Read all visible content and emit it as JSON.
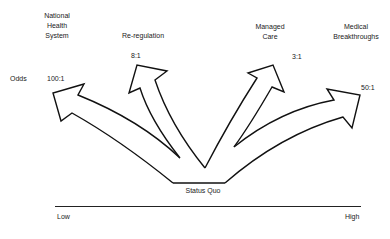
{
  "options": [
    {
      "name_lines": [
        "National",
        "Health",
        "System"
      ],
      "odds": "100:1"
    },
    {
      "name_lines": [
        "Re-regulation"
      ],
      "odds": "8:1"
    },
    {
      "name_lines": [
        "Managed",
        "Care"
      ],
      "odds": "3:1"
    },
    {
      "name_lines": [
        "Medical",
        "Breakthroughs"
      ],
      "odds": "50:1"
    }
  ],
  "odds_label": "Odds",
  "origin_label": "Status Quo",
  "axis": {
    "low_label": "Low",
    "high_label": "High"
  },
  "colors": {
    "stroke": "#111111",
    "background": "#ffffff"
  }
}
